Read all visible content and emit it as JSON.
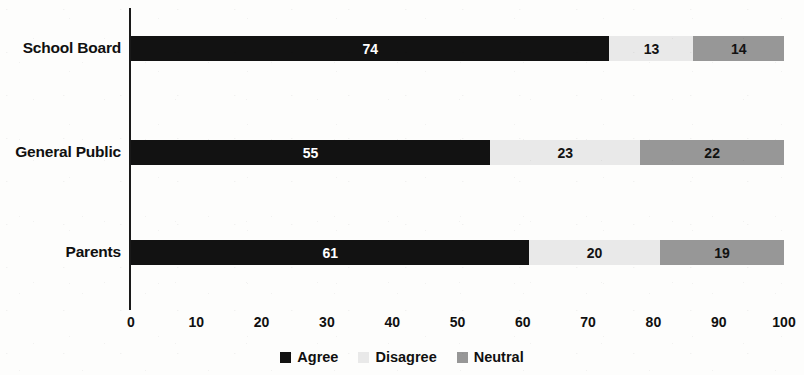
{
  "chart_data": {
    "type": "bar",
    "orientation": "horizontal",
    "stacked": true,
    "title": "",
    "subtitle": "",
    "xlabel": "",
    "ylabel": "",
    "xlim": [
      0,
      100
    ],
    "xticks": [
      0,
      10,
      20,
      30,
      40,
      50,
      60,
      70,
      80,
      90,
      100
    ],
    "xtick_labels": [
      "0",
      "10",
      "20",
      "30",
      "40",
      "50",
      "60",
      "70",
      "80",
      "90",
      "100"
    ],
    "grid": false,
    "legend_position": "bottom-center",
    "categories": [
      "School Board",
      "General Public",
      "Parents"
    ],
    "series": [
      {
        "name": "Agree",
        "color": "#121212",
        "label_color": "#ffffff",
        "values": [
          74,
          55,
          61
        ],
        "value_labels": [
          "74",
          "55",
          "61"
        ]
      },
      {
        "name": "Disagree",
        "color": "#e9e9e9",
        "label_color": "#121212",
        "values": [
          13,
          23,
          20
        ],
        "value_labels": [
          "13",
          "23",
          "20"
        ]
      },
      {
        "name": "Neutral",
        "color": "#979797",
        "label_color": "#121212",
        "values": [
          14,
          22,
          19
        ],
        "value_labels": [
          "14",
          "22",
          "19"
        ]
      }
    ],
    "rows": [
      {
        "category": "School Board",
        "segments": [
          {
            "name": "Agree",
            "value": 74,
            "label": "74"
          },
          {
            "name": "Disagree",
            "value": 13,
            "label": "13"
          },
          {
            "name": "Neutral",
            "value": 14,
            "label": "14"
          }
        ]
      },
      {
        "category": "General Public",
        "segments": [
          {
            "name": "Agree",
            "value": 55,
            "label": "55"
          },
          {
            "name": "Disagree",
            "value": 23,
            "label": "23"
          },
          {
            "name": "Neutral",
            "value": 22,
            "label": "22"
          }
        ]
      },
      {
        "category": "Parents",
        "segments": [
          {
            "name": "Agree",
            "value": 61,
            "label": "61"
          },
          {
            "name": "Disagree",
            "value": 20,
            "label": "20"
          },
          {
            "name": "Neutral",
            "value": 19,
            "label": "19"
          }
        ]
      }
    ]
  },
  "legend": {
    "items": [
      {
        "label": "Agree",
        "color": "#121212"
      },
      {
        "label": "Disagree",
        "color": "#e9e9e9"
      },
      {
        "label": "Neutral",
        "color": "#979797"
      }
    ]
  },
  "colors": {
    "background": "#fdfdfc",
    "axis": "#1a1a1a",
    "text": "#101010",
    "agree": "#121212",
    "disagree": "#e9e9e9",
    "neutral": "#979797"
  }
}
